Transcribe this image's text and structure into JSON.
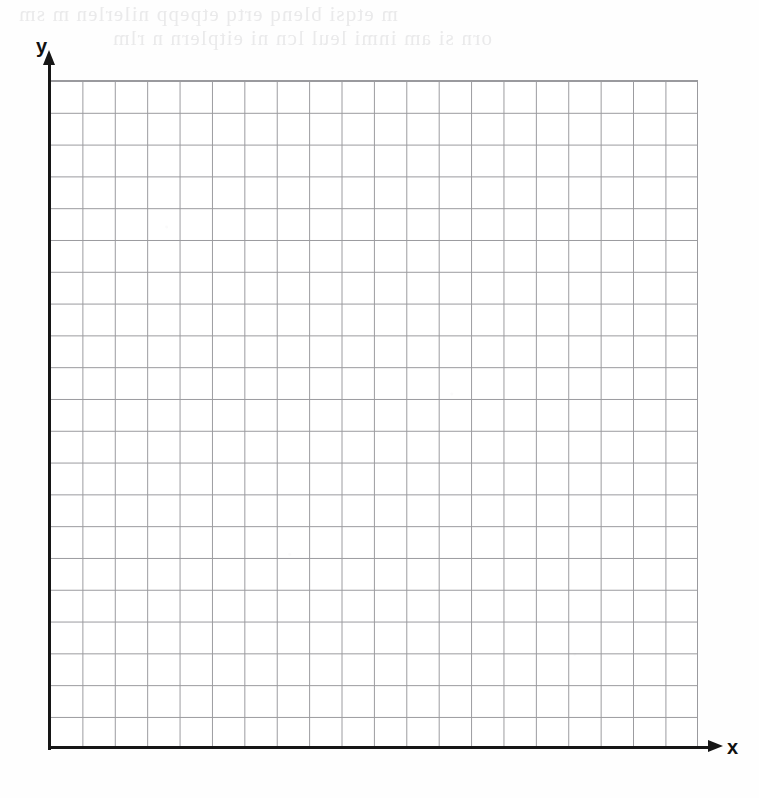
{
  "page": {
    "width": 759,
    "height": 798,
    "background_color": "#fefefe"
  },
  "bleed_through_text": {
    "note": "Faint mirrored show-through from the reverse side of the page; illegible",
    "color": "#e9e9ea",
    "line_1": "m etqsi blenq ertq etpepp nilerlen m sm",
    "line_2": "orn si am inmi leul lcn ni eitplern n rlm"
  },
  "axes": {
    "x": {
      "label": "x",
      "label_color": "#111111",
      "line_color": "#161616",
      "arrow": "right-arrow-icon"
    },
    "y": {
      "label": "y",
      "label_color": "#111111",
      "line_color": "#161616",
      "arrow": "up-arrow-icon"
    }
  },
  "chart_data": {
    "type": "scatter",
    "title": "",
    "subtitle": "",
    "xlabel": "x",
    "ylabel": "y",
    "series": [
      {
        "name": "",
        "x": [],
        "y": []
      }
    ],
    "annotations": [],
    "legend": null,
    "legend_position": "none",
    "grid": true,
    "grid_color": "#9a9a9e",
    "grid_columns": 20,
    "grid_rows": 21,
    "grid_cell_px": 32,
    "xlim": [
      0,
      20
    ],
    "ylim": [
      0,
      21
    ],
    "xticks": [],
    "yticks": [],
    "tick_labels_shown": false,
    "note": "Empty graph-paper grid with no plotted data points, curves or tick labels; intended for a student to draw on."
  }
}
